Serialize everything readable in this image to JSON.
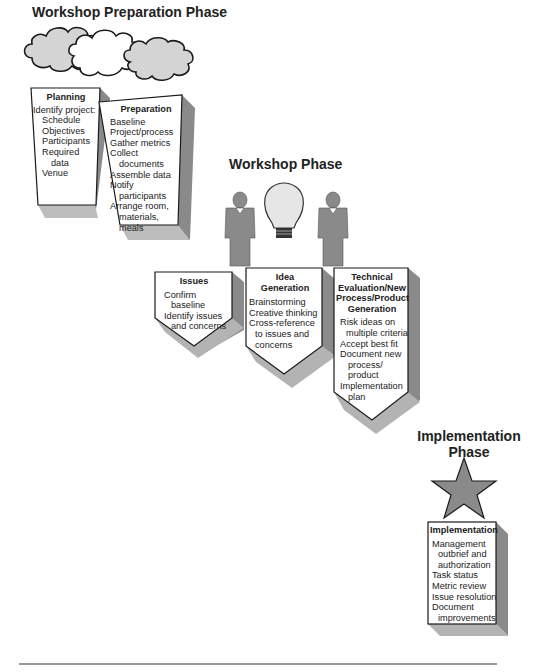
{
  "phases": {
    "preparation": {
      "title": "Workshop Preparation Phase"
    },
    "workshop": {
      "title": "Workshop Phase"
    },
    "implementation": {
      "title_line1": "Implementation",
      "title_line2": "Phase"
    }
  },
  "boxes": {
    "planning": {
      "heading": "Planning",
      "items": [
        "Identify project:",
        "Schedule",
        "Objectives",
        "Participants",
        "Required",
        "data",
        "Venue"
      ]
    },
    "preparation": {
      "heading": "Preparation",
      "items": [
        "Baseline",
        "Project/process",
        "Gather metrics",
        "Collect",
        "documents",
        "Assemble data",
        "Notify",
        "participants",
        "Arrange room,",
        "materials,",
        "meals"
      ]
    },
    "issues": {
      "heading": "Issues",
      "items": [
        "Confirm",
        "baseline",
        "Identify issues",
        "and concerns"
      ]
    },
    "idea_generation": {
      "heading_line1": "Idea",
      "heading_line2": "Generation",
      "items": [
        "Brainstorming",
        "Creative thinking",
        "Cross-reference",
        "to issues and",
        "concerns"
      ]
    },
    "technical": {
      "heading_line1": "Technical",
      "heading_line2": "Evaluation/New",
      "heading_line3": "Process/Product",
      "heading_line4": "Generation",
      "items": [
        "Risk ideas on",
        "multiple criteria",
        "Accept best fit",
        "Document new",
        "process/",
        "product",
        "Implementation",
        "plan"
      ]
    },
    "implementation": {
      "heading": "Implementation",
      "items": [
        "Management",
        "outbrief and",
        "authorization",
        "Task status",
        "Metric review",
        "Issue resolution",
        "Document",
        "improvements"
      ]
    }
  },
  "icons": [
    "cloud-icon",
    "person-icon",
    "lightbulb-icon",
    "star-icon"
  ],
  "colors": {
    "fill_gray": "#d4d4d4",
    "dark_gray": "#7a7a7a",
    "shadow": "#9a9a9a",
    "outline": "#1a1a1a"
  }
}
